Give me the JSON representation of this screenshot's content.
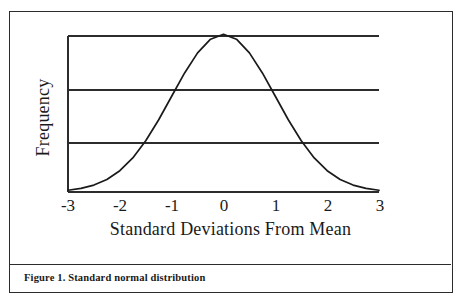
{
  "figure": {
    "caption": "Figure 1. Standard normal distribution"
  },
  "chart_data": {
    "type": "line",
    "title": "",
    "xlabel": "Standard Deviations From Mean",
    "ylabel": "Frequency",
    "xlim": [
      -3,
      3
    ],
    "ylim": [
      0,
      1
    ],
    "xticks": [
      -3,
      -2,
      -1,
      0,
      1,
      2,
      3
    ],
    "xtick_labels": [
      "-3",
      "-2",
      "-1",
      "0",
      "1",
      "2",
      "3"
    ],
    "yticks": [],
    "ytick_labels": [],
    "grid": "horizontal",
    "gridline_count": 3,
    "legend": "none",
    "line_color": "#1a1a1a",
    "axis_color": "#2c2c2c",
    "series": [
      {
        "name": "standard normal density",
        "description": "Gaussian bell curve, mean 0, standard deviation 1",
        "x": [
          -3.0,
          -2.75,
          -2.5,
          -2.25,
          -2.0,
          -1.75,
          -1.5,
          -1.25,
          -1.0,
          -0.75,
          -0.5,
          -0.25,
          0.0,
          0.25,
          0.5,
          0.75,
          1.0,
          1.25,
          1.5,
          1.75,
          2.0,
          2.25,
          2.5,
          2.75,
          3.0
        ],
        "y": [
          0.011,
          0.023,
          0.044,
          0.079,
          0.135,
          0.216,
          0.325,
          0.458,
          0.607,
          0.755,
          0.882,
          0.969,
          1.0,
          0.969,
          0.882,
          0.755,
          0.607,
          0.458,
          0.325,
          0.216,
          0.135,
          0.079,
          0.044,
          0.023,
          0.011
        ]
      }
    ]
  },
  "axis": {
    "x_title": "Standard Deviations From Mean",
    "y_title": "Frequency",
    "tick_0": "-3",
    "tick_1": "-2",
    "tick_2": "-1",
    "tick_3": "0",
    "tick_4": "1",
    "tick_5": "2",
    "tick_6": "3"
  },
  "colors": {
    "ink": "#1a1a1a",
    "frame": "#2c2c2c",
    "background": "#ffffff"
  }
}
